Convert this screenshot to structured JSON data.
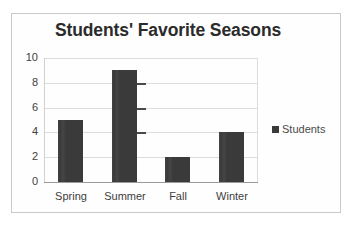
{
  "chart_data": {
    "type": "bar",
    "title": "Students' Favorite Seasons",
    "categories": [
      "Spring",
      "Summer",
      "Fall",
      "Winter"
    ],
    "values": [
      5,
      9,
      2,
      4
    ],
    "series": [
      {
        "name": "Students",
        "values": [
          5,
          9,
          2,
          4
        ]
      }
    ],
    "xlabel": "",
    "ylabel": "",
    "ylim": [
      0,
      10
    ],
    "yticks": [
      0,
      2,
      4,
      6,
      8,
      10
    ],
    "ytick_labels": [
      "0",
      "2",
      "4",
      "6",
      "8",
      "10"
    ],
    "grid": true,
    "legend": {
      "position": "right",
      "entries": [
        "Students"
      ]
    },
    "bar_color": "#3a3a3a",
    "gridline_color": "#dddddd",
    "title_color": "#2b2b2b",
    "background_color": "#ffffff",
    "border_color": "#c9c9c9",
    "annotations": [
      {
        "label": "scan-artifact-dash",
        "near_value": 8
      },
      {
        "label": "scan-artifact-dash",
        "near_value": 6
      },
      {
        "label": "scan-artifact-dash",
        "near_value": 4
      }
    ]
  },
  "legend": {
    "swatch_name": "students-swatch",
    "label": "Students"
  }
}
